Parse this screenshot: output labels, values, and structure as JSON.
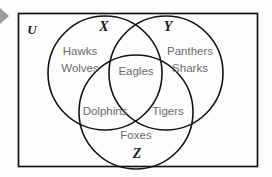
{
  "diagram": {
    "type": "venn-3-set",
    "universe": {
      "label": "U",
      "name": "universal-set"
    },
    "sets": [
      {
        "id": "X",
        "label": "X",
        "name": "set-x"
      },
      {
        "id": "Y",
        "label": "Y",
        "name": "set-y"
      },
      {
        "id": "Z",
        "label": "Z",
        "name": "set-z"
      }
    ],
    "regions": [
      {
        "id": "x-only",
        "sets": [
          "X"
        ],
        "members": [
          "Hawks",
          "Wolves"
        ],
        "line1": "Hawks",
        "line2": "Wolves"
      },
      {
        "id": "y-only",
        "sets": [
          "Y"
        ],
        "members": [
          "Panthers",
          "Sharks"
        ],
        "line1": "Panthers",
        "line2": "Sharks"
      },
      {
        "id": "x-and-y",
        "sets": [
          "X",
          "Y"
        ],
        "members": [
          "Eagles"
        ],
        "line1": "Eagles"
      },
      {
        "id": "x-and-z",
        "sets": [
          "X",
          "Z"
        ],
        "members": [
          "Dolphins"
        ],
        "line1": "Dolphins"
      },
      {
        "id": "y-and-z",
        "sets": [
          "Y",
          "Z"
        ],
        "members": [
          "Tigers"
        ],
        "line1": "Tigers"
      },
      {
        "id": "z-only",
        "sets": [
          "Z"
        ],
        "members": [
          "Foxes"
        ],
        "line1": "Foxes"
      }
    ],
    "colors": {
      "outline": "#141414",
      "member_text": "#6b6b6b",
      "set_text": "#1a1a1a",
      "background": "#fdfdfd",
      "pointer": "#9a9a9a"
    }
  },
  "pointer": {
    "name": "left-edge-arrow",
    "glyph": "arrow-right"
  }
}
